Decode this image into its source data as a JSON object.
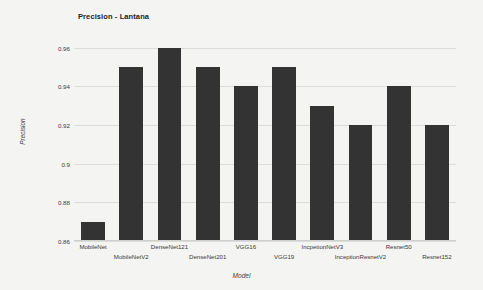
{
  "chart_data": {
    "type": "bar",
    "title": "Precision - Lantana",
    "xlabel": "Model",
    "ylabel": "Precision",
    "ylim": [
      0.86,
      0.965
    ],
    "yticks": [
      "0.96",
      "0.94",
      "0.92",
      "0.9",
      "0.88",
      "0.86"
    ],
    "ytick_values": [
      0.96,
      0.94,
      0.92,
      0.9,
      0.88,
      0.86
    ],
    "grid": true,
    "legend": "none",
    "bar_color": "#333333",
    "background_color": "#f4f4f2",
    "gridline_color": "#dcdcda",
    "categories": [
      "MobileNet",
      "MobileNetV2",
      "DenseNet121",
      "DenseNet201",
      "VGG16",
      "VGG19",
      "IncpetionNetV3",
      "InceptionResnetV2",
      "Resnet50",
      "Resnet152"
    ],
    "values": [
      0.87,
      0.95,
      0.96,
      0.95,
      0.94,
      0.95,
      0.93,
      0.92,
      0.94,
      0.92
    ]
  }
}
